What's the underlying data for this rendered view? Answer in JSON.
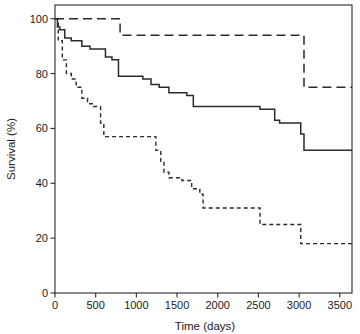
{
  "chart_data": {
    "type": "line",
    "title": "",
    "xlabel": "Time (days)",
    "ylabel": "Survival (%)",
    "xlim": [
      0,
      3650
    ],
    "ylim": [
      0,
      105
    ],
    "grid": false,
    "legend": "none",
    "xticks": [
      0,
      500,
      1000,
      1500,
      2000,
      2500,
      3000,
      3500
    ],
    "xticklabels": [
      "0",
      "500",
      "1000",
      "1500",
      "2000",
      "2500",
      "3000",
      "3500"
    ],
    "yticks": [
      0,
      20,
      40,
      60,
      80,
      100
    ],
    "yticklabels": [
      "0",
      "20",
      "40",
      "60",
      "80",
      "100"
    ],
    "step_style": "post",
    "series": [
      {
        "name": "long-dashed-curve",
        "style": "long-dash",
        "color": "#2b2b2b",
        "x": [
          0,
          780,
          800,
          3040,
          3060,
          3650
        ],
        "y": [
          100,
          100,
          94,
          94,
          75,
          75
        ]
      },
      {
        "name": "solid-curve",
        "style": "solid",
        "color": "#2b2b2b",
        "x": [
          0,
          30,
          60,
          120,
          200,
          330,
          430,
          620,
          700,
          780,
          1080,
          1180,
          1280,
          1400,
          1620,
          1700,
          2460,
          2520,
          2700,
          2760,
          3020,
          3060,
          3650
        ],
        "y": [
          100,
          97,
          96,
          93,
          92,
          90,
          89,
          86,
          85,
          79,
          78,
          76,
          75,
          73,
          72,
          68,
          68,
          67,
          63,
          62,
          58,
          52,
          52
        ]
      },
      {
        "name": "short-dashed-curve",
        "style": "short-dash",
        "color": "#2b2b2b",
        "x": [
          0,
          40,
          90,
          140,
          200,
          260,
          330,
          400,
          470,
          560,
          600,
          1200,
          1240,
          1300,
          1340,
          1400,
          1560,
          1620,
          1680,
          1780,
          1820,
          2480,
          2520,
          2980,
          3020,
          3650
        ],
        "y": [
          100,
          92,
          85,
          80,
          78,
          75,
          71,
          69,
          68,
          62,
          57,
          57,
          52,
          48,
          44,
          42,
          41,
          41,
          38,
          36,
          31,
          31,
          25,
          25,
          18,
          18
        ]
      }
    ]
  },
  "plot_area": {
    "left": 55,
    "top": 5,
    "right": 352,
    "bottom": 293
  }
}
